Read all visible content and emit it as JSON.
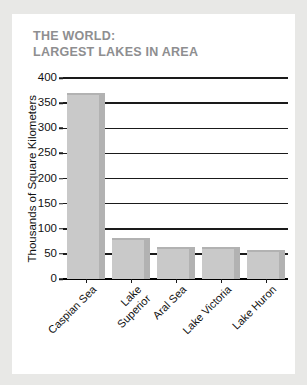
{
  "card": {
    "background_color": "#ffffff",
    "page_background_color": "#e8e8e6"
  },
  "title": {
    "line1": "THE WORLD:",
    "line2": "LARGEST LAKES IN AREA",
    "color": "#8e8e90"
  },
  "chart_data": {
    "type": "bar",
    "title": "THE WORLD: LARGEST LAKES IN AREA",
    "subtitle": "",
    "categories": [
      "Caspian Sea",
      "Lake Superior",
      "Aral Sea",
      "Lake Victoria",
      "Lake Huron"
    ],
    "category_labels_wrapped": [
      "Caspian Sea",
      "Lake\nSuperior",
      "Aral Sea",
      "Lake Victoria",
      "Lake Huron"
    ],
    "values": [
      371,
      82,
      64,
      63,
      58
    ],
    "xlabel": "",
    "ylabel": "Thousands of Square Kilometers",
    "ylim": [
      0,
      400
    ],
    "ytick_values": [
      0,
      50,
      100,
      150,
      200,
      250,
      300,
      350,
      400
    ],
    "ytick_labels": [
      "0",
      "50",
      "100",
      "150",
      "200",
      "250",
      "300",
      "350",
      "400"
    ],
    "grid": true,
    "grid_axis": "y",
    "legend": false,
    "bar_color": "#c9c9c9",
    "bar_side_color": "#b2b2b2",
    "gridline_color": "#1a1a1a",
    "tick_label_color": "#111111"
  }
}
